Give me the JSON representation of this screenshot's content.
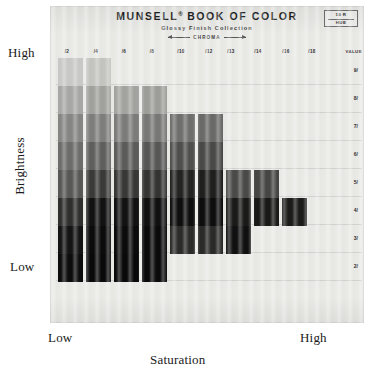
{
  "header": {
    "title": "MUNSELL",
    "title_reg": "®",
    "title_rest": "BOOK OF COLOR",
    "subtitle": "Glossy Finish Collection",
    "chroma_axis_label": "CHROMA",
    "hue_badge_top": "10 R",
    "hue_badge_bottom": "HUE"
  },
  "axes": {
    "y_title": "Brightness",
    "y_high": "High",
    "y_low": "Low",
    "x_title": "Saturation",
    "x_low": "Low",
    "x_high": "High",
    "value_column_header": "VALUE"
  },
  "chart_data": {
    "type": "heatmap",
    "xlabel": "Saturation",
    "ylabel": "Brightness",
    "x_axis_name": "CHROMA",
    "y_axis_name": "VALUE",
    "grid": true,
    "legend_position": "none",
    "categories": [
      "/2",
      "/4",
      "/6",
      "/8",
      "/10",
      "/12",
      "/13",
      "/14",
      "/16",
      "/18"
    ],
    "row_labels": [
      "9/",
      "8/",
      "7/",
      "6/",
      "5/",
      "4/",
      "3/",
      "2/"
    ],
    "x_tick_px": [
      67,
      96,
      124,
      152,
      181,
      209,
      231,
      258,
      286,
      312
    ],
    "y_tick_px": [
      70,
      98,
      126,
      154,
      182,
      210,
      238,
      266
    ],
    "cells": [
      {
        "col": 0,
        "row": 0,
        "color": "#c9c9c7"
      },
      {
        "col": 0,
        "row": 1,
        "color": "#a8a8a6"
      },
      {
        "col": 0,
        "row": 2,
        "color": "#868685"
      },
      {
        "col": 0,
        "row": 3,
        "color": "#6d6d6c"
      },
      {
        "col": 0,
        "row": 4,
        "color": "#585857"
      },
      {
        "col": 0,
        "row": 5,
        "color": "#2f2f2e"
      },
      {
        "col": 0,
        "row": 6,
        "color": "#141414"
      },
      {
        "col": 0,
        "row": 7,
        "color": "#0c0c0c"
      },
      {
        "col": 1,
        "row": 0,
        "color": "#c4c4c1"
      },
      {
        "col": 1,
        "row": 1,
        "color": "#a1a19e"
      },
      {
        "col": 1,
        "row": 2,
        "color": "#7e7e7c"
      },
      {
        "col": 1,
        "row": 3,
        "color": "#5f5f5e"
      },
      {
        "col": 1,
        "row": 4,
        "color": "#3a3a39"
      },
      {
        "col": 1,
        "row": 5,
        "color": "#121212"
      },
      {
        "col": 1,
        "row": 6,
        "color": "#0b0b0b"
      },
      {
        "col": 1,
        "row": 7,
        "color": "#090909"
      },
      {
        "col": 2,
        "row": 1,
        "color": "#a3a3a0"
      },
      {
        "col": 2,
        "row": 2,
        "color": "#7c7c7a"
      },
      {
        "col": 2,
        "row": 3,
        "color": "#5c5c5b"
      },
      {
        "col": 2,
        "row": 4,
        "color": "#383837"
      },
      {
        "col": 2,
        "row": 5,
        "color": "#121212"
      },
      {
        "col": 2,
        "row": 6,
        "color": "#0b0b0b"
      },
      {
        "col": 2,
        "row": 7,
        "color": "#090909"
      },
      {
        "col": 3,
        "row": 1,
        "color": "#9d9d9a"
      },
      {
        "col": 3,
        "row": 2,
        "color": "#787876"
      },
      {
        "col": 3,
        "row": 3,
        "color": "#575756"
      },
      {
        "col": 3,
        "row": 4,
        "color": "#343433"
      },
      {
        "col": 3,
        "row": 5,
        "color": "#101010"
      },
      {
        "col": 3,
        "row": 6,
        "color": "#0a0a0a"
      },
      {
        "col": 3,
        "row": 7,
        "color": "#0a0a0a"
      },
      {
        "col": 4,
        "row": 2,
        "color": "#6f6f6d"
      },
      {
        "col": 4,
        "row": 3,
        "color": "#4f4f4e"
      },
      {
        "col": 4,
        "row": 4,
        "color": "#232322"
      },
      {
        "col": 4,
        "row": 5,
        "color": "#0e0e0e"
      },
      {
        "col": 4,
        "row": 6,
        "color": "#2b2b2a"
      },
      {
        "col": 5,
        "row": 2,
        "color": "#6a6a68"
      },
      {
        "col": 5,
        "row": 3,
        "color": "#4a4a49"
      },
      {
        "col": 5,
        "row": 4,
        "color": "#1f1f1e"
      },
      {
        "col": 5,
        "row": 5,
        "color": "#0d0d0d"
      },
      {
        "col": 5,
        "row": 6,
        "color": "#2a2a29"
      },
      {
        "col": 6,
        "row": 4,
        "color": "#4a4a49"
      },
      {
        "col": 6,
        "row": 5,
        "color": "#1a1a19"
      },
      {
        "col": 6,
        "row": 6,
        "color": "#101010"
      },
      {
        "col": 7,
        "row": 4,
        "color": "#464645"
      },
      {
        "col": 7,
        "row": 5,
        "color": "#191918"
      },
      {
        "col": 8,
        "row": 5,
        "color": "#1b1b1a"
      }
    ]
  },
  "chip_layout": {
    "columns_px": [
      {
        "x": 58,
        "w": 25
      },
      {
        "x": 86,
        "w": 25
      },
      {
        "x": 114,
        "w": 25
      },
      {
        "x": 142,
        "w": 25
      },
      {
        "x": 170,
        "w": 25
      },
      {
        "x": 198,
        "w": 25
      },
      {
        "x": 226,
        "w": 25
      },
      {
        "x": 254,
        "w": 25
      },
      {
        "x": 282,
        "w": 25
      },
      {
        "x": 310,
        "w": 25
      }
    ],
    "rows_px": [
      {
        "y": 58,
        "h": 28
      },
      {
        "y": 86,
        "h": 28
      },
      {
        "y": 114,
        "h": 28
      },
      {
        "y": 142,
        "h": 28
      },
      {
        "y": 170,
        "h": 28
      },
      {
        "y": 198,
        "h": 28
      },
      {
        "y": 226,
        "h": 28
      },
      {
        "y": 254,
        "h": 28
      }
    ]
  }
}
